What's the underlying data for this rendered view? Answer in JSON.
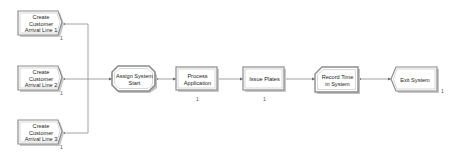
{
  "diagram": {
    "blocks": [
      {
        "id": "create1",
        "type": "create",
        "label": "Create Customer Arrival Line 1",
        "counter": "1"
      },
      {
        "id": "create2",
        "type": "create",
        "label": "Create Customer Arrival Line 2",
        "counter": "1"
      },
      {
        "id": "create3",
        "type": "create",
        "label": "Create Customer Arrival Line 3",
        "counter": "1"
      },
      {
        "id": "assign",
        "type": "assign",
        "label": "Assign System Start"
      },
      {
        "id": "process",
        "type": "process",
        "label": "Process Application",
        "counter": "1"
      },
      {
        "id": "issue",
        "type": "process",
        "label": "Issue Plates",
        "counter": "1"
      },
      {
        "id": "record",
        "type": "record",
        "label": "Record Time in System"
      },
      {
        "id": "dispose",
        "type": "dispose",
        "label": "Exit System",
        "counter": "1"
      }
    ],
    "colors": {
      "line": "#7a7a7a",
      "block_fill": "#ffffff",
      "block_border": "#8c8c8c",
      "block_shadow": "#c8c8c8"
    }
  }
}
